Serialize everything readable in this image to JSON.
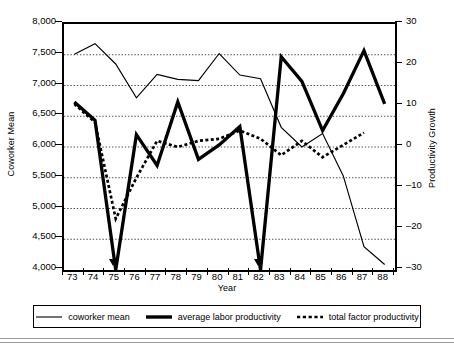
{
  "chart_data": {
    "type": "line",
    "title": "",
    "xlabel": "Year",
    "ylabel": "Coworker Mean",
    "ylabel_secondary": "Productivity Growth",
    "grid": true,
    "legend_position": "bottom",
    "x": [
      73,
      74,
      75,
      76,
      77,
      78,
      79,
      80,
      81,
      82,
      83,
      84,
      85,
      86,
      87,
      88
    ],
    "xtick_labels": [
      "73",
      "74",
      "75",
      "76",
      "77",
      "78",
      "79",
      "80",
      "81",
      "82",
      "83",
      "84",
      "85",
      "86",
      "87",
      "88"
    ],
    "xlim": [
      72.5,
      88.5
    ],
    "ylim": [
      4000,
      8000
    ],
    "ytick_labels": [
      "4,000",
      "4,500",
      "5,000",
      "5,500",
      "6,000",
      "6,500",
      "7,000",
      "7,500",
      "8,000"
    ],
    "ytick_values": [
      4000,
      4500,
      5000,
      5500,
      6000,
      6500,
      7000,
      7500,
      8000
    ],
    "ylim_secondary": [
      -30,
      30
    ],
    "ytick_labels_secondary": [
      "-30",
      "-20",
      "-10",
      "0",
      "10",
      "20",
      "30"
    ],
    "ytick_values_secondary": [
      -30,
      -20,
      -10,
      0,
      10,
      20,
      30
    ],
    "annotations": [
      {
        "label": "marker-arrow-1975",
        "x": 75
      },
      {
        "label": "marker-arrow-1982",
        "x": 82
      }
    ],
    "series": [
      {
        "name": "coworker mean",
        "axis": "left",
        "style": "thin-solid",
        "values": [
          7510,
          7680,
          7350,
          6800,
          7180,
          7100,
          7080,
          7520,
          7170,
          7110,
          6320,
          6000,
          6220,
          5530,
          4380,
          4090
        ]
      },
      {
        "name": "average labor productivity",
        "axis": "right",
        "style": "thick-solid",
        "values": [
          11.0,
          6.5,
          -30.0,
          3.0,
          -4.5,
          11.0,
          -3.0,
          0.5,
          5.0,
          -30.0,
          22.0,
          16.0,
          4.0,
          13.0,
          23.5,
          10.5
        ]
      },
      {
        "name": "total factor productivity",
        "axis": "right",
        "style": "dotted",
        "values": [
          10.5,
          6.0,
          -17.5,
          -7.5,
          1.5,
          0.0,
          1.5,
          2.0,
          4.0,
          2.0,
          -2.0,
          1.5,
          -2.5,
          0.5,
          3.5,
          null
        ]
      }
    ]
  },
  "legend": {
    "items": [
      {
        "label": "coworker mean",
        "style": "thin-solid"
      },
      {
        "label": "average labor productivity",
        "style": "thick-solid"
      },
      {
        "label": "total factor productivity",
        "style": "dotted"
      }
    ]
  }
}
